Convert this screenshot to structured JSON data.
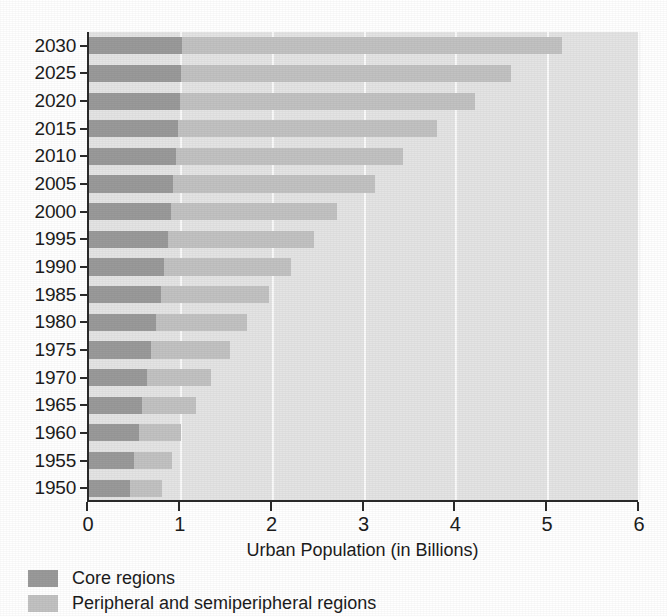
{
  "chart_data": {
    "type": "bar",
    "orientation": "horizontal",
    "stacked": true,
    "title": "",
    "xlabel": "Urban Population (in Billions)",
    "ylabel": "",
    "xlim": [
      0,
      6
    ],
    "xticks": [
      "0",
      "1",
      "2",
      "3",
      "4",
      "5",
      "6"
    ],
    "grid": true,
    "grid_axis": "x",
    "legend_position": "below-left",
    "categories": [
      "2030",
      "2025",
      "2020",
      "2015",
      "2010",
      "2005",
      "2000",
      "1995",
      "1990",
      "1985",
      "1980",
      "1975",
      "1970",
      "1965",
      "1960",
      "1955",
      "1950"
    ],
    "series": [
      {
        "name": "Core regions",
        "color": "#9a9a9a",
        "values": [
          1.01,
          1.0,
          0.99,
          0.97,
          0.95,
          0.92,
          0.89,
          0.86,
          0.82,
          0.78,
          0.73,
          0.68,
          0.63,
          0.58,
          0.54,
          0.49,
          0.45
        ]
      },
      {
        "name": "Peripheral and semiperipheral regions",
        "color": "#c2c2c2",
        "values": [
          4.14,
          3.6,
          3.21,
          2.82,
          2.47,
          2.19,
          1.81,
          1.59,
          1.38,
          1.18,
          0.99,
          0.86,
          0.7,
          0.59,
          0.46,
          0.41,
          0.35
        ]
      }
    ],
    "totals": [
      5.15,
      4.6,
      4.2,
      3.79,
      3.42,
      3.11,
      2.7,
      2.45,
      2.2,
      1.96,
      1.72,
      1.54,
      1.33,
      1.17,
      1.0,
      0.9,
      0.8
    ]
  },
  "axis": {
    "x_title": "Urban Population (in Billions)",
    "x_ticks": [
      "0",
      "1",
      "2",
      "3",
      "4",
      "5",
      "6"
    ],
    "y_ticks": [
      "2030",
      "2025",
      "2020",
      "2015",
      "2010",
      "2005",
      "2000",
      "1995",
      "1990",
      "1985",
      "1980",
      "1975",
      "1970",
      "1965",
      "1960",
      "1955",
      "1950"
    ]
  },
  "legend": {
    "items": [
      {
        "label": "Core regions",
        "color": "#9a9a9a"
      },
      {
        "label": "Peripheral and semiperipheral regions",
        "color": "#c2c2c2"
      }
    ]
  },
  "colors": {
    "core": "#9a9a9a",
    "periphery": "#c2c2c2",
    "plot_background": "#e4e4e4",
    "gridline": "#fafafa",
    "axis": "#2a2a2a"
  }
}
